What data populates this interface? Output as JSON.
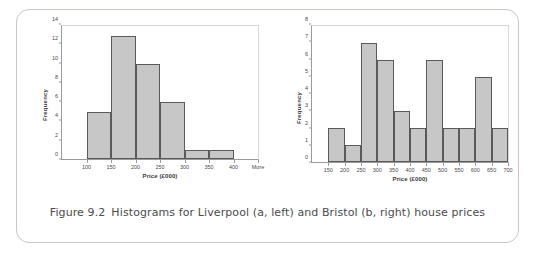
{
  "figure": {
    "caption_label": "Figure 9.2",
    "caption_text": "Histograms for Liverpool (a, left) and Bristol (b, right) house prices"
  },
  "colors": {
    "bar_fill": "#c7c7c7",
    "bar_stroke": "#5a5a5a",
    "axis": "#9a9a9a",
    "text": "#4a4a4a",
    "frame": "#c9c6c0"
  },
  "chart_data": [
    {
      "id": "liverpool",
      "type": "bar",
      "title": "",
      "xlabel": "Price (£000)",
      "ylabel": "Frequency",
      "categories": [
        "100",
        "150",
        "200",
        "250",
        "300",
        "350",
        "400",
        "More"
      ],
      "bin_edges": [
        100,
        150,
        200,
        250,
        300,
        350,
        400
      ],
      "values": [
        5,
        13,
        10,
        6,
        1,
        1
      ],
      "ylim": [
        0,
        14
      ],
      "yticks": [
        0,
        2,
        4,
        6,
        8,
        10,
        12,
        14
      ],
      "xticks": [
        "100",
        "150",
        "200",
        "250",
        "300",
        "350",
        "400",
        "More"
      ],
      "grid": false,
      "legend": "none"
    },
    {
      "id": "bristol",
      "type": "bar",
      "title": "",
      "xlabel": "Price (£000)",
      "ylabel": "Frequency",
      "categories": [
        "150",
        "200",
        "250",
        "300",
        "350",
        "400",
        "450",
        "500",
        "550",
        "600",
        "650",
        "700"
      ],
      "bin_edges": [
        150,
        200,
        250,
        300,
        350,
        400,
        450,
        500,
        550,
        600,
        650,
        700
      ],
      "values": [
        2,
        1,
        7,
        6,
        3,
        2,
        6,
        2,
        2,
        5,
        2
      ],
      "ylim": [
        0,
        8
      ],
      "yticks": [
        0,
        1,
        2,
        3,
        4,
        5,
        6,
        7,
        8
      ],
      "xticks": [
        "150",
        "200",
        "250",
        "300",
        "350",
        "400",
        "450",
        "500",
        "550",
        "600",
        "650",
        "700"
      ],
      "grid": false,
      "legend": "none"
    }
  ]
}
